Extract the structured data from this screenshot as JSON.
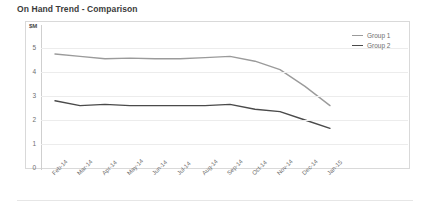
{
  "chart_title": "On Hand Trend - Comparison",
  "axis": {
    "y_unit_label": "$M",
    "y_ticks": [
      "5",
      "4",
      "3",
      "2",
      "1",
      "0"
    ],
    "x_ticks": [
      "Feb-14",
      "Mar-14",
      "Apr-14",
      "May-14",
      "Jun-14",
      "Jul-14",
      "Aug-14",
      "Sep-14",
      "Oct-14",
      "Nov-14",
      "Dec-14",
      "Jan-15"
    ]
  },
  "legend": {
    "items": [
      {
        "label": "Group 1",
        "color": "#9b9b9b"
      },
      {
        "label": "Group 2",
        "color": "#4a4a4a"
      }
    ]
  },
  "colors": {
    "group1": "#9b9b9b",
    "group2": "#4a4a4a",
    "grid": "#ececec",
    "frame": "#d9d9d9",
    "text": "#6e6e6e",
    "title": "#3b3b3b"
  },
  "chart_data": {
    "type": "line",
    "title": "On Hand Trend - Comparison",
    "xlabel": "",
    "ylabel": "$M",
    "ylim": [
      0,
      5
    ],
    "grid": true,
    "legend_position": "top-right",
    "categories": [
      "Feb-14",
      "Mar-14",
      "Apr-14",
      "May-14",
      "Jun-14",
      "Jul-14",
      "Aug-14",
      "Sep-14",
      "Oct-14",
      "Nov-14",
      "Dec-14",
      "Jan-15"
    ],
    "series": [
      {
        "name": "Group 1",
        "color": "#9b9b9b",
        "values": [
          4.75,
          4.65,
          4.55,
          4.58,
          4.55,
          4.55,
          4.6,
          4.65,
          4.45,
          4.1,
          3.4,
          2.6
        ]
      },
      {
        "name": "Group 2",
        "color": "#4a4a4a",
        "values": [
          2.8,
          2.6,
          2.65,
          2.6,
          2.6,
          2.6,
          2.6,
          2.65,
          2.45,
          2.35,
          2.0,
          1.65
        ]
      }
    ]
  }
}
